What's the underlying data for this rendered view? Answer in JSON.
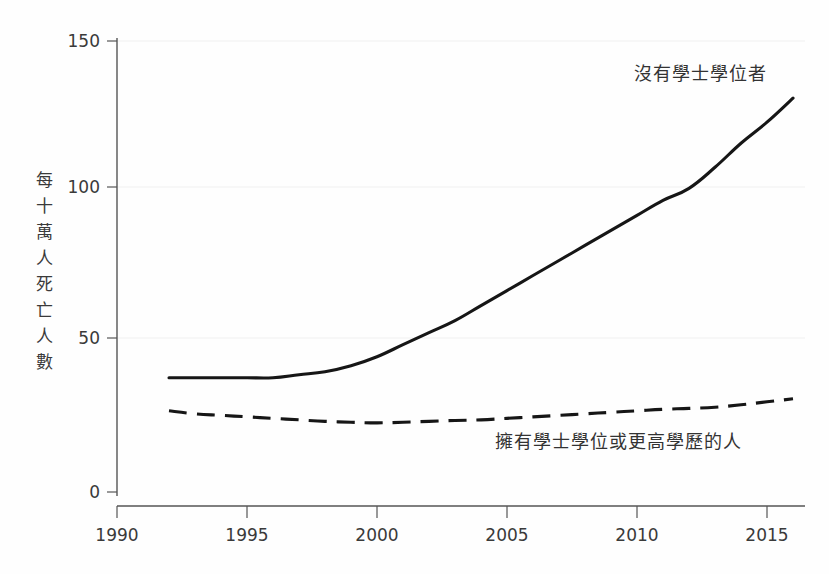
{
  "chart_data": {
    "type": "line",
    "title": "",
    "subtitle": "",
    "xlabel": "",
    "ylabel": "每十萬人死亡人數",
    "ylabel_chars": [
      "每",
      "十",
      "萬",
      "人",
      "死",
      "亡",
      "人",
      "數"
    ],
    "xlim": [
      1989,
      2017
    ],
    "ylim": [
      0,
      150
    ],
    "x_ticks": [
      1990,
      1995,
      2000,
      2005,
      2010,
      2015
    ],
    "x_tick_labels": [
      "1990",
      "1995",
      "2000",
      "2005",
      "2010",
      "2015"
    ],
    "y_ticks": [
      0,
      50,
      100,
      150
    ],
    "y_tick_labels": [
      "0",
      "50",
      "100",
      "150"
    ],
    "grid": "horizontal-faint",
    "legend_position": "inline-annotations",
    "line_color": "#161616",
    "axis_color": "#555555",
    "background_color": "#fefefe",
    "x": [
      1992,
      1993,
      1994,
      1995,
      1996,
      1997,
      1998,
      1999,
      2000,
      2001,
      2002,
      2003,
      2004,
      2005,
      2006,
      2007,
      2008,
      2009,
      2010,
      2011,
      2012,
      2013,
      2014,
      2015,
      2016
    ],
    "series": [
      {
        "name": "沒有學士學位者",
        "style": "solid",
        "annotation": "沒有學士學位者",
        "annotation_x": 2014,
        "annotation_y": 143,
        "values": [
          38,
          38,
          38,
          38,
          38,
          39,
          40,
          42,
          45,
          49,
          53,
          57,
          62,
          67,
          72,
          77,
          82,
          87,
          92,
          97,
          101,
          108,
          116,
          123,
          131
        ]
      },
      {
        "name": "擁有學士學位或更高學歷的人",
        "style": "dashed",
        "annotation": "擁有學士學位或更高學歷的人",
        "annotation_x": 2007,
        "annotation_y": 16,
        "values": [
          27,
          26,
          25.5,
          25,
          24.5,
          24,
          23.5,
          23.2,
          23,
          23.2,
          23.5,
          23.8,
          24,
          24.5,
          25,
          25.5,
          26,
          26.5,
          27,
          27.5,
          27.8,
          28.2,
          29,
          30,
          31
        ]
      }
    ]
  }
}
